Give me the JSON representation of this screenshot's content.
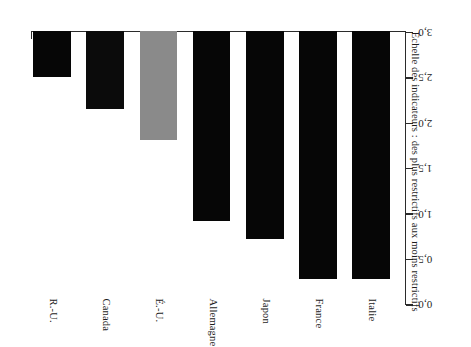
{
  "chart_data": {
    "type": "bar",
    "title": "",
    "subtitle": "",
    "xlabel": "",
    "ylabel": "Échelle des indicateurs : des plus restrictifs aux moins restrictifs",
    "categories": [
      "Italie",
      "France",
      "Japon",
      "Allemagne",
      "É.-U.",
      "Canada",
      "R.-U."
    ],
    "values": [
      2.73,
      2.73,
      2.29,
      2.09,
      1.2,
      0.85,
      0.5
    ],
    "series": [
      {
        "name": "Indicateur",
        "values": [
          2.73,
          2.73,
          2.29,
          2.09,
          1.2,
          0.85,
          0.5
        ]
      }
    ],
    "bar_colors": [
      "#060606",
      "#060606",
      "#060606",
      "#060606",
      "#8a8a8a",
      "#0b0b0b",
      "#060606"
    ],
    "ylim": [
      0,
      3.0
    ],
    "y_inverted": true,
    "yticks": [
      0,
      0.5,
      1,
      1.5,
      2,
      2.5,
      3
    ],
    "ytick_labels": [
      "0,0",
      "0,5",
      "1,0",
      "1,5",
      "2,0",
      "2,5",
      "3,0"
    ],
    "grid": false,
    "legend": false,
    "legend_position": "none",
    "orientation": "vertical",
    "rotation_deg": 180,
    "annotations": []
  },
  "axis": {
    "title": "Échelle des indicateurs : des plus restrictifs aux moins restrictifs",
    "tick_labels": [
      "0,0",
      "0,5",
      "1,0",
      "1,5",
      "2,0",
      "2,5",
      "3,0"
    ]
  },
  "bars": [
    {
      "label": "Italie",
      "value": 2.73,
      "color": "#060606"
    },
    {
      "label": "France",
      "value": 2.73,
      "color": "#060606"
    },
    {
      "label": "Japon",
      "value": 2.29,
      "color": "#060606"
    },
    {
      "label": "Allemagne",
      "value": 2.09,
      "color": "#060606"
    },
    {
      "label": "É.-U.",
      "value": 1.2,
      "color": "#8a8a8a"
    },
    {
      "label": "Canada",
      "value": 0.85,
      "color": "#0b0b0b"
    },
    {
      "label": "R.-U.",
      "value": 0.5,
      "color": "#060606"
    }
  ]
}
